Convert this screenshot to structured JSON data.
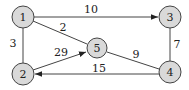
{
  "diagram": {
    "type": "weighted-graph",
    "nodes": [
      {
        "id": "1",
        "label": "1",
        "x": 23,
        "y": 17
      },
      {
        "id": "2",
        "label": "2",
        "x": 23,
        "y": 74
      },
      {
        "id": "3",
        "label": "3",
        "x": 170,
        "y": 17
      },
      {
        "id": "4",
        "label": "4",
        "x": 170,
        "y": 72
      },
      {
        "id": "5",
        "label": "5",
        "x": 97,
        "y": 48
      }
    ],
    "edges": [
      {
        "from": "1",
        "to": "3",
        "weight": "10",
        "directed": true
      },
      {
        "from": "1",
        "to": "5",
        "weight": "2",
        "directed": false
      },
      {
        "from": "1",
        "to": "2",
        "weight": "3",
        "directed": false
      },
      {
        "from": "2",
        "to": "5",
        "weight": "29",
        "directed": true
      },
      {
        "from": "5",
        "to": "4",
        "weight": "9",
        "directed": false
      },
      {
        "from": "4",
        "to": "2",
        "weight": "15",
        "directed": true
      },
      {
        "from": "3",
        "to": "4",
        "weight": "7",
        "directed": false
      }
    ]
  }
}
